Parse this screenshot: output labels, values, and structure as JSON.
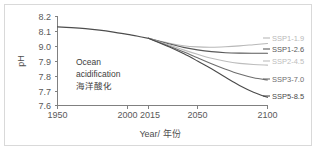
{
  "chart_data": {
    "type": "line",
    "title": "",
    "annotation": {
      "line1": "Ocean",
      "line2": "acidification",
      "line3": "海洋酸化"
    },
    "xlabel": "Year/ 年份",
    "ylabel": "pH",
    "xlim": [
      1950,
      2100
    ],
    "ylim": [
      7.6,
      8.2
    ],
    "grid": false,
    "legend_position": "right",
    "x_ticks": [
      1950,
      2000,
      2015,
      2050,
      2100
    ],
    "x_tick_labels": [
      "1950",
      "2000",
      "2015",
      "2050",
      "2100"
    ],
    "y_ticks": [
      7.6,
      7.7,
      7.8,
      7.9,
      9.0,
      8.1,
      8.2
    ],
    "y_tick_labels": [
      "7.6",
      "7.7",
      "7.8",
      "7.9",
      "9.0",
      "8.1",
      "8.2"
    ],
    "series": [
      {
        "name": "historical",
        "label": "",
        "color": "#4d4d4d",
        "x": [
          1950,
          1960,
          1970,
          1980,
          1990,
          2000,
          2010,
          2015
        ],
        "values": [
          8.13,
          8.125,
          8.118,
          8.108,
          8.095,
          8.08,
          8.062,
          8.053
        ]
      },
      {
        "name": "SSP1-1.9",
        "label": "SSP1-1.9",
        "color": "#b8b8b8",
        "x": [
          2015,
          2030,
          2040,
          2050,
          2060,
          2070,
          2080,
          2090,
          2100
        ],
        "values": [
          8.053,
          8.02,
          8.003,
          7.995,
          7.993,
          7.996,
          8.002,
          8.01,
          8.018
        ]
      },
      {
        "name": "SSP1-2.6",
        "label": "SSP1-2.6",
        "color": "#595959",
        "x": [
          2015,
          2030,
          2040,
          2050,
          2060,
          2070,
          2080,
          2090,
          2100
        ],
        "values": [
          8.053,
          8.015,
          7.992,
          7.975,
          7.963,
          7.956,
          7.953,
          7.952,
          7.952
        ]
      },
      {
        "name": "SSP2-4.5",
        "label": "SSP2-4.5",
        "color": "#bdbdbd",
        "x": [
          2015,
          2030,
          2040,
          2050,
          2060,
          2070,
          2080,
          2090,
          2100
        ],
        "values": [
          8.053,
          8.008,
          7.975,
          7.945,
          7.918,
          7.898,
          7.884,
          7.876,
          7.872
        ]
      },
      {
        "name": "SSP3-7.0",
        "label": "SSP3-7.0",
        "color": "#6e6e6e",
        "x": [
          2015,
          2030,
          2040,
          2050,
          2060,
          2070,
          2080,
          2090,
          2100
        ],
        "values": [
          8.053,
          8.0,
          7.962,
          7.922,
          7.882,
          7.845,
          7.812,
          7.787,
          7.772
        ]
      },
      {
        "name": "SSP5-8.5",
        "label": "SSP5-8.5",
        "color": "#4a4a4a",
        "x": [
          2015,
          2030,
          2040,
          2050,
          2060,
          2070,
          2080,
          2090,
          2100
        ],
        "values": [
          8.053,
          7.995,
          7.95,
          7.9,
          7.848,
          7.79,
          7.735,
          7.69,
          7.655
        ]
      }
    ]
  },
  "legend": {
    "items": [
      {
        "label": "SSP1-1.9",
        "color": "#b8b8b8"
      },
      {
        "label": "SSP1-2.6",
        "color": "#595959"
      },
      {
        "label": "SSP2-4.5",
        "color": "#bdbdbd"
      },
      {
        "label": "SSP3-7.0",
        "color": "#6e6e6e"
      },
      {
        "label": "SSP5-8.5",
        "color": "#4a4a4a"
      }
    ]
  },
  "axes": {
    "y_title": "pH",
    "x_title": "Year/ 年份",
    "y_labels": [
      "8.2",
      "8.1",
      "9.0",
      "7.9",
      "7.8",
      "7.7",
      "7.6"
    ],
    "x_labels": [
      "1950",
      "2000",
      "2015",
      "2050",
      "2100"
    ]
  },
  "annotation": {
    "line1": "Ocean",
    "line2": "acidification",
    "line3": "海洋酸化"
  }
}
